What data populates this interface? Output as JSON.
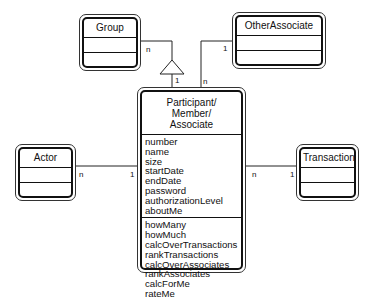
{
  "classes": {
    "group": {
      "name": "Group"
    },
    "other_associate": {
      "name": "OtherAssociate"
    },
    "actor": {
      "name": "Actor"
    },
    "transaction": {
      "name": "Transaction"
    },
    "participant": {
      "name_lines": [
        "Participant/",
        "Member/",
        "Associate"
      ],
      "attributes": [
        "number",
        "name",
        "size",
        "startDate",
        "endDate",
        "password",
        "authorizationLevel",
        "aboutMe"
      ],
      "operations": [
        "howMany",
        "howMuch",
        "calcOverTransactions",
        "rankTransactions",
        "calcOverAssociates",
        "rankAssociates",
        "calcForMe",
        "rateMe"
      ]
    }
  },
  "associations": {
    "group_participant": {
      "group_end": "n",
      "participant_end": "1",
      "type": "generalization"
    },
    "other_associate_participant": {
      "other_end": "1",
      "participant_end": "n"
    },
    "actor_participant": {
      "actor_end": "n",
      "participant_end": "1"
    },
    "participant_transaction": {
      "participant_end": "n",
      "transaction_end": "1"
    }
  }
}
